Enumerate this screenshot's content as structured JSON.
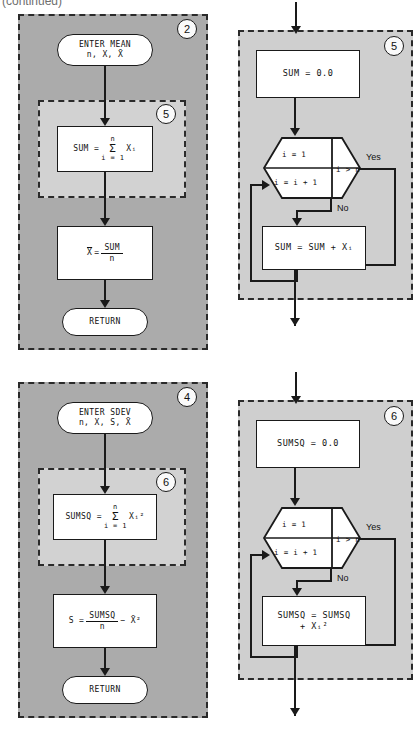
{
  "caption": "(continued)",
  "colors": {
    "outer_panel_fill": "#ababab",
    "inner_panel_fill": "#d2d2d2",
    "right_panel_fill": "#cfcfcf",
    "node_fill": "#ffffff",
    "line": "#1a1a1a",
    "page_bg": "#ffffff"
  },
  "diagram": {
    "type": "flowchart",
    "panels": [
      {
        "id": "panel-2",
        "badge": "2",
        "title": "MEAN subprogram",
        "nodes": [
          {
            "name": "terminator-enter-mean",
            "shape": "terminal",
            "line1": "ENTER MEAN",
            "line2": "n, X, X̄"
          },
          {
            "name": "process-sum",
            "shape": "process",
            "expr": "SUM = Σ Xᵢ",
            "limit_top": "n",
            "limit_bottom": "i = 1",
            "inside_subpanel": "5"
          },
          {
            "name": "process-mean",
            "shape": "process",
            "lhs": "X̄ =",
            "numerator": "SUM",
            "denominator": "n"
          },
          {
            "name": "terminator-return",
            "shape": "terminal",
            "line1": "RETURN"
          }
        ],
        "subpanel_badge": "5"
      },
      {
        "id": "panel-5",
        "badge": "5",
        "title": "SUM accumulation loop",
        "nodes": [
          {
            "name": "process-init-sum",
            "shape": "process",
            "text": "SUM = 0.0"
          },
          {
            "name": "loop-hexagon",
            "shape": "hexagon",
            "init": "i = 1",
            "increment": "i = i + 1",
            "test": "i > n",
            "yes_label": "Yes",
            "no_label": "No"
          },
          {
            "name": "process-accumulate-sum",
            "shape": "process",
            "text": "SUM = SUM + Xᵢ"
          }
        ]
      },
      {
        "id": "panel-4",
        "badge": "4",
        "title": "SDEV subprogram",
        "nodes": [
          {
            "name": "terminator-enter-sdev",
            "shape": "terminal",
            "line1": "ENTER SDEV",
            "line2": "n, X, S, X̄"
          },
          {
            "name": "process-sumsq",
            "shape": "process",
            "expr": "SUMSQ = Σ Xᵢ²",
            "limit_top": "n",
            "limit_bottom": "i = 1",
            "inside_subpanel": "6"
          },
          {
            "name": "process-sdev",
            "shape": "process",
            "lhs": "S =",
            "numerator": "SUMSQ",
            "denominator": "n",
            "tail": "− X̄²"
          },
          {
            "name": "terminator-return",
            "shape": "terminal",
            "line1": "RETURN"
          }
        ],
        "subpanel_badge": "6"
      },
      {
        "id": "panel-6",
        "badge": "6",
        "title": "SUMSQ accumulation loop",
        "nodes": [
          {
            "name": "process-init-sumsq",
            "shape": "process",
            "text": "SUMSQ = 0.0"
          },
          {
            "name": "loop-hexagon",
            "shape": "hexagon",
            "init": "i = 1",
            "increment": "i = i + 1",
            "test": "i > n",
            "yes_label": "Yes",
            "no_label": "No"
          },
          {
            "name": "process-accumulate-sumsq",
            "shape": "process",
            "line1": "SUMSQ = SUMSQ",
            "line2": "+ Xᵢ²"
          }
        ]
      }
    ]
  },
  "labels": {
    "enter_mean_1": "ENTER MEAN",
    "enter_mean_2": "n, X, X̄",
    "sum_assign": "SUM =",
    "sigma": "Σ",
    "x_i": "Xᵢ",
    "limit_n": "n",
    "limit_i1": "i = 1",
    "xbar": "X̄",
    "eq": "=",
    "sum_word": "SUM",
    "n_word": "n",
    "return": "RETURN",
    "sum_init": "SUM = 0.0",
    "sumsq_init": "SUMSQ = 0.0",
    "loop_init": "i = 1",
    "loop_inc": "i = i + 1",
    "loop_test": "i > n",
    "yes": "Yes",
    "no": "No",
    "accum_sum": "SUM = SUM + Xᵢ",
    "enter_sdev_1": "ENTER SDEV",
    "enter_sdev_2": "n, X, S, X̄",
    "sumsq_assign": "SUMSQ =",
    "x_i_sq": "Xᵢ²",
    "s_assign": "S =",
    "sumsq_word": "SUMSQ",
    "minus_xbar_sq": "− X̄²",
    "accum_sumsq_1": "SUMSQ = SUMSQ",
    "accum_sumsq_2": "+ Xᵢ²",
    "badge_2": "2",
    "badge_5": "5",
    "badge_4": "4",
    "badge_6": "6",
    "badge_5_inner": "5",
    "badge_6_inner": "6"
  }
}
